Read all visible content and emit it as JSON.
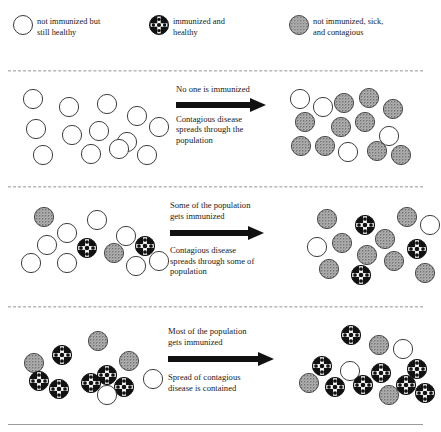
{
  "diagram": {
    "legend": [
      {
        "icon": "open-circle-icon",
        "type": "healthy",
        "equals": "=",
        "label": "not immunized but\nstill healthy"
      },
      {
        "icon": "checkered-circle-icon",
        "type": "immunized",
        "equals": "=",
        "label": "immunized and\nhealthy"
      },
      {
        "icon": "speckled-circle-icon",
        "type": "sick",
        "equals": "=",
        "label": "not immunized, sick,\nand contagious"
      }
    ],
    "colors": {
      "sick_fill": "#a6a6a6",
      "sick_speckle": "#6e6e6e",
      "immunized_fill": "#111111",
      "immunized_mark": "#ffffff",
      "healthy_fill": "#ffffff",
      "outline": "#3a3a3a",
      "arrow": "#111111",
      "divider": "#b9b9b9",
      "text": "#1a1a1a"
    },
    "rows": [
      {
        "id": "row-no-immunization",
        "caption_top": "No one is immunized",
        "caption_bottom": "Contagious disease\nspreads through the\npopulation",
        "before": {
          "counts": {
            "healthy": 13,
            "immunized": 0,
            "sick": 0
          },
          "tokens": [
            {
              "type": "healthy",
              "x": 14,
              "y": 8
            },
            {
              "type": "healthy",
              "x": 50,
              "y": 16
            },
            {
              "type": "healthy",
              "x": 88,
              "y": 13
            },
            {
              "type": "healthy",
              "x": 118,
              "y": 25
            },
            {
              "type": "healthy",
              "x": 140,
              "y": 36
            },
            {
              "type": "healthy",
              "x": 17,
              "y": 38
            },
            {
              "type": "healthy",
              "x": 53,
              "y": 44
            },
            {
              "type": "healthy",
              "x": 80,
              "y": 40
            },
            {
              "type": "healthy",
              "x": 108,
              "y": 51
            },
            {
              "type": "healthy",
              "x": 24,
              "y": 64
            },
            {
              "type": "healthy",
              "x": 72,
              "y": 63
            },
            {
              "type": "healthy",
              "x": 100,
              "y": 58
            },
            {
              "type": "healthy",
              "x": 128,
              "y": 64
            }
          ]
        },
        "after": {
          "counts": {
            "healthy": 4,
            "immunized": 0,
            "sick": 10
          },
          "tokens": [
            {
              "type": "healthy",
              "x": 1,
              "y": 8
            },
            {
              "type": "healthy",
              "x": 24,
              "y": 16
            },
            {
              "type": "sick",
              "x": 45,
              "y": 12
            },
            {
              "type": "sick",
              "x": 70,
              "y": 7
            },
            {
              "type": "sick",
              "x": 94,
              "y": 18
            },
            {
              "type": "sick",
              "x": 6,
              "y": 31
            },
            {
              "type": "sick",
              "x": 42,
              "y": 36
            },
            {
              "type": "sick",
              "x": 66,
              "y": 31
            },
            {
              "type": "sick",
              "x": 2,
              "y": 55
            },
            {
              "type": "sick",
              "x": 26,
              "y": 55
            },
            {
              "type": "healthy",
              "x": 49,
              "y": 61
            },
            {
              "type": "healthy",
              "x": 90,
              "y": 45
            },
            {
              "type": "sick",
              "x": 78,
              "y": 60
            },
            {
              "type": "sick",
              "x": 102,
              "y": 64
            }
          ]
        }
      },
      {
        "id": "row-some-immunization",
        "caption_top": "Some of the population\ngets immunized",
        "caption_bottom": "Contagious disease\nspreads through some of\npopulation",
        "before": {
          "counts": {
            "healthy": 9,
            "immunized": 2,
            "sick": 2
          },
          "tokens": [
            {
              "type": "sick",
              "x": 25,
              "y": 6
            },
            {
              "type": "healthy",
              "x": 78,
              "y": 9
            },
            {
              "type": "healthy",
              "x": 48,
              "y": 22
            },
            {
              "type": "healthy",
              "x": 107,
              "y": 25
            },
            {
              "type": "healthy",
              "x": 28,
              "y": 34
            },
            {
              "type": "immunized",
              "x": 68,
              "y": 37
            },
            {
              "type": "sick",
              "x": 95,
              "y": 42
            },
            {
              "type": "immunized",
              "x": 126,
              "y": 35
            },
            {
              "type": "healthy",
              "x": 12,
              "y": 52
            },
            {
              "type": "healthy",
              "x": 48,
              "y": 52
            },
            {
              "type": "healthy",
              "x": 117,
              "y": 55
            },
            {
              "type": "healthy",
              "x": 140,
              "y": 50
            }
          ]
        },
        "after": {
          "counts": {
            "healthy": 2,
            "immunized": 3,
            "sick": 9
          },
          "tokens": [
            {
              "type": "sick",
              "x": 28,
              "y": 8
            },
            {
              "type": "immunized",
              "x": 66,
              "y": 14
            },
            {
              "type": "sick",
              "x": 108,
              "y": 6
            },
            {
              "type": "healthy",
              "x": 131,
              "y": 14
            },
            {
              "type": "healthy",
              "x": 18,
              "y": 36
            },
            {
              "type": "sick",
              "x": 43,
              "y": 32
            },
            {
              "type": "sick",
              "x": 86,
              "y": 28
            },
            {
              "type": "immunized",
              "x": 118,
              "y": 38
            },
            {
              "type": "sick",
              "x": 68,
              "y": 44
            },
            {
              "type": "sick",
              "x": 95,
              "y": 50
            },
            {
              "type": "sick",
              "x": 30,
              "y": 58
            },
            {
              "type": "immunized",
              "x": 62,
              "y": 64
            },
            {
              "type": "sick",
              "x": 126,
              "y": 62
            }
          ]
        }
      },
      {
        "id": "row-most-immunization",
        "caption_top": "Most of the population\ngets immunized",
        "caption_bottom": "Spread of contagious\ndisease is contained",
        "before": {
          "counts": {
            "healthy": 2,
            "immunized": 7,
            "sick": 3
          },
          "tokens": [
            {
              "type": "sick",
              "x": 79,
              "y": 8
            },
            {
              "type": "immunized",
              "x": 43,
              "y": 22
            },
            {
              "type": "sick",
              "x": 15,
              "y": 30
            },
            {
              "type": "sick",
              "x": 110,
              "y": 28
            },
            {
              "type": "immunized",
              "x": 88,
              "y": 42
            },
            {
              "type": "immunized",
              "x": 20,
              "y": 48
            },
            {
              "type": "immunized",
              "x": 72,
              "y": 50
            },
            {
              "type": "immunized",
              "x": 40,
              "y": 56
            },
            {
              "type": "immunized",
              "x": 105,
              "y": 54
            },
            {
              "type": "healthy",
              "x": 88,
              "y": 62
            },
            {
              "type": "healthy",
              "x": 134,
              "y": 46
            }
          ]
        },
        "after": {
          "counts": {
            "healthy": 2,
            "immunized": 9,
            "sick": 3
          },
          "tokens": [
            {
              "type": "immunized",
              "x": 58,
              "y": 2
            },
            {
              "type": "sick",
              "x": 86,
              "y": 12
            },
            {
              "type": "healthy",
              "x": 110,
              "y": 16
            },
            {
              "type": "immunized",
              "x": 29,
              "y": 33
            },
            {
              "type": "healthy",
              "x": 57,
              "y": 38
            },
            {
              "type": "immunized",
              "x": 88,
              "y": 40
            },
            {
              "type": "immunized",
              "x": 124,
              "y": 36
            },
            {
              "type": "sick",
              "x": 16,
              "y": 50
            },
            {
              "type": "immunized",
              "x": 42,
              "y": 54
            },
            {
              "type": "immunized",
              "x": 70,
              "y": 52
            },
            {
              "type": "immunized",
              "x": 113,
              "y": 52
            },
            {
              "type": "sick",
              "x": 96,
              "y": 62
            },
            {
              "type": "immunized",
              "x": 132,
              "y": 60
            }
          ]
        }
      }
    ]
  }
}
